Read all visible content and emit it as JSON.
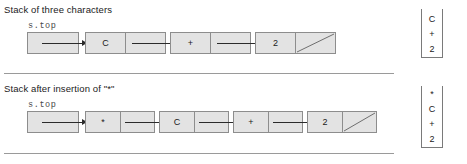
{
  "figure": {
    "sections": [
      {
        "caption": "Stack of three characters",
        "pointer_label": "s.top",
        "nodes": [
          {
            "value": "C",
            "next": "pointer"
          },
          {
            "value": "+",
            "next": "pointer"
          },
          {
            "value": "2",
            "next": "null"
          }
        ],
        "stack_panel": {
          "items": [
            "C",
            "+",
            "2"
          ]
        }
      },
      {
        "caption": "Stack after insertion of \"*\"",
        "pointer_label": "s.top",
        "nodes": [
          {
            "value": "*",
            "next": "pointer"
          },
          {
            "value": "C",
            "next": "pointer"
          },
          {
            "value": "+",
            "next": "pointer"
          },
          {
            "value": "2",
            "next": "null"
          }
        ],
        "stack_panel": {
          "items": [
            "*",
            "C",
            "+",
            "2"
          ]
        }
      }
    ],
    "colors": {
      "node_fill": "#e3e3e3",
      "node_border": "#8d8d8d",
      "arrow": "#2b2b2b",
      "rule": "#9a9a9a",
      "text": "#1a1a1a",
      "panel_border": "#7a7a7a"
    }
  }
}
